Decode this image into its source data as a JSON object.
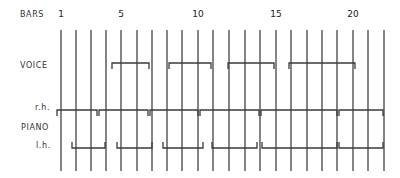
{
  "labels": {
    "bars": "BARS",
    "voice": "VOICE",
    "piano": "PIANO",
    "rh": "r.h.",
    "lh": "l.h."
  },
  "bar_numbers": [
    {
      "text": "1",
      "x": 61
    },
    {
      "text": "5",
      "x": 121
    },
    {
      "text": "10",
      "x": 198
    },
    {
      "text": "15",
      "x": 276
    },
    {
      "text": "20",
      "x": 353
    }
  ],
  "bar_lines_x": [
    61,
    76,
    91,
    106,
    121,
    137,
    152,
    167,
    182,
    198,
    213,
    229,
    245,
    260,
    276,
    291,
    307,
    322,
    337,
    353,
    368,
    384
  ],
  "bar_lines_y": [
    30,
    171
  ],
  "voice_phrases": [
    {
      "x1": 112,
      "x2": 149
    },
    {
      "x1": 169,
      "x2": 211
    },
    {
      "x1": 228,
      "x2": 274
    },
    {
      "x1": 289,
      "x2": 355
    }
  ],
  "rh_phrases": [
    {
      "x1": 57,
      "x2": 97
    },
    {
      "x1": 99,
      "x2": 148
    },
    {
      "x1": 150,
      "x2": 198
    },
    {
      "x1": 200,
      "x2": 259
    },
    {
      "x1": 261,
      "x2": 337
    },
    {
      "x1": 339,
      "x2": 383
    }
  ],
  "lh_phrases": [
    {
      "x1": 72,
      "x2": 105
    },
    {
      "x1": 117,
      "x2": 152
    },
    {
      "x1": 163,
      "x2": 203
    },
    {
      "x1": 212,
      "x2": 257
    },
    {
      "x1": 262,
      "x2": 337
    },
    {
      "x1": 339,
      "x2": 383
    }
  ],
  "colors": {
    "line": "#333333",
    "bracket": "#3a3a3a"
  }
}
